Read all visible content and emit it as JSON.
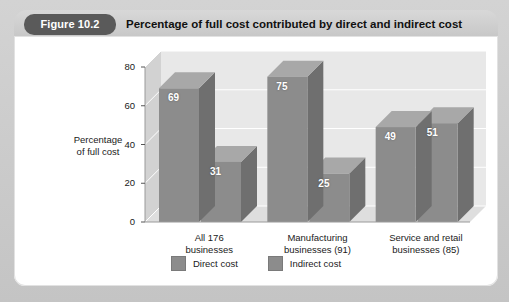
{
  "figure": {
    "pill_label": "Figure 10.2",
    "title": "Percentage of full cost contributed by direct and indirect cost"
  },
  "colors": {
    "mat": "#cccccc",
    "header_bar": "#cfcfcf",
    "pill": "#5a5a5a",
    "panel": "#ffffff",
    "bar_front": "#8c8c8c",
    "bar_side": "#6f6f6f",
    "bar_top": "#a8a8a8",
    "wall_back": "#e8e8e8",
    "wall_left": "#d2d2d2",
    "floor": "#dedede",
    "gridline": "#ffffff"
  },
  "chart_data": {
    "type": "bar",
    "title": "Percentage of full cost contributed by direct and indirect cost",
    "xlabel": "",
    "ylabel": "Percentage of full cost",
    "ylabel_lines": [
      "Percentage",
      "of full cost"
    ],
    "ylim": [
      0,
      80
    ],
    "yticks": [
      0,
      20,
      40,
      60,
      80
    ],
    "ytick_labels": [
      "0",
      "20",
      "40",
      "60",
      "80"
    ],
    "grid": true,
    "legend_position": "bottom",
    "threed": true,
    "categories": [
      "All 176 businesses",
      "Manufacturing businesses (91)",
      "Service and retail businesses (85)"
    ],
    "category_lines": [
      [
        "All 176",
        "businesses"
      ],
      [
        "Manufacturing",
        "businesses (91)"
      ],
      [
        "Service and retail",
        "businesses (85)"
      ]
    ],
    "series": [
      {
        "name": "Direct cost",
        "values": [
          69,
          75,
          49
        ]
      },
      {
        "name": "Indirect cost",
        "values": [
          31,
          25,
          51
        ]
      }
    ]
  },
  "legend": {
    "items": [
      {
        "label": "Direct cost"
      },
      {
        "label": "Indirect cost"
      }
    ]
  }
}
